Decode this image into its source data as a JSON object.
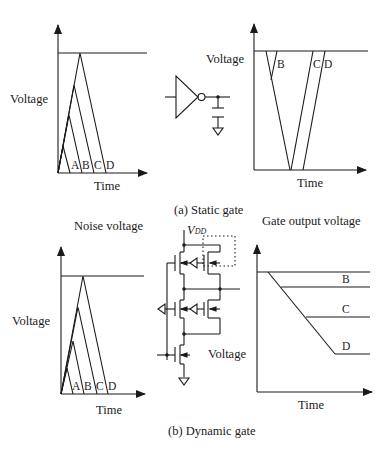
{
  "figure": {
    "panel_a": {
      "caption": "(a) Static gate",
      "noise_plot": {
        "ylabel": "Voltage",
        "xlabel": "Time",
        "pulse_labels": [
          "A",
          "B",
          "C",
          "D"
        ]
      },
      "output_plot": {
        "ylabel": "Voltage",
        "xlabel": "Time",
        "curve_labels": [
          "B",
          "C",
          "D"
        ]
      }
    },
    "panel_b": {
      "caption": "(b) Dynamic gate",
      "noise_plot": {
        "title": "Noise voltage",
        "ylabel": "Voltage",
        "xlabel": "Time",
        "pulse_labels": [
          "A",
          "B",
          "C",
          "D"
        ]
      },
      "circuit": {
        "supply_label": "V",
        "supply_subscript": "DD",
        "node_label": "Voltage"
      },
      "output_plot": {
        "title": "Gate output voltage",
        "xlabel": "Time",
        "curve_labels": [
          "B",
          "C",
          "D"
        ]
      }
    }
  }
}
